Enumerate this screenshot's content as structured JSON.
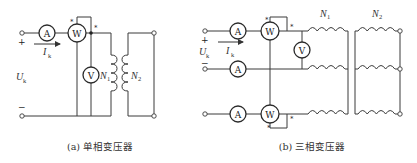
{
  "figure_a": {
    "caption": "(a) 单相变压器",
    "meters": {
      "ammeter": "A",
      "wattmeter": "W",
      "voltmeter": "V"
    },
    "labels": {
      "voltage": "U",
      "voltage_sub": "k",
      "current": "I",
      "current_sub": "k",
      "primary": "N",
      "primary_sub": "1",
      "secondary": "N",
      "secondary_sub": "2",
      "plus": "+",
      "minus": "−",
      "polarity": "*"
    }
  },
  "figure_b": {
    "caption": "(b) 三相变压器",
    "meters": {
      "ammeter": "A",
      "wattmeter": "W",
      "voltmeter": "V"
    },
    "labels": {
      "voltage": "U",
      "voltage_sub": "k",
      "current": "I",
      "current_sub": "k",
      "primary": "N",
      "primary_sub": "1",
      "secondary": "N",
      "secondary_sub": "2",
      "plus": "+",
      "minus": "−",
      "polarity": "*"
    }
  }
}
